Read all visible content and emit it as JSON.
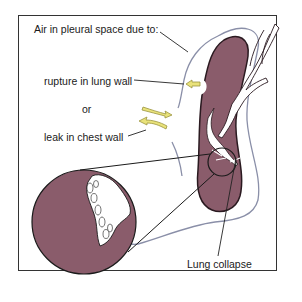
{
  "diagram": {
    "labels": {
      "cause_heading": "Air in pleural space due to:",
      "cause_1": "rupture in lung wall",
      "or": "or",
      "cause_2": "leak in chest wall",
      "result": "Lung collapse"
    },
    "colors": {
      "lung": "#8a5c6b",
      "lung_outline": "#2a1a20",
      "pleura": "#8a8fa8",
      "arrow": "#e9e27a",
      "arrow_outline": "#9a9440",
      "frame": "#333333",
      "leader_line": "#222222"
    }
  }
}
